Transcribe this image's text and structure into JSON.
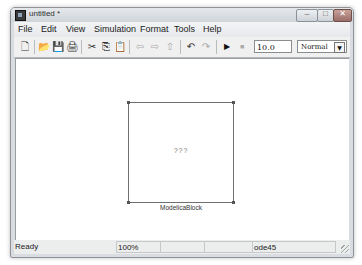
{
  "window": {
    "title": "untitled *",
    "icon": "simulink-model-icon",
    "controls": {
      "minimize": "–",
      "maximize": "□",
      "close": "✕"
    }
  },
  "menubar": {
    "items": [
      {
        "label": "File"
      },
      {
        "label": "Edit"
      },
      {
        "label": "View"
      },
      {
        "label": "Simulation"
      },
      {
        "label": "Format"
      },
      {
        "label": "Tools"
      },
      {
        "label": "Help"
      }
    ]
  },
  "toolbar": {
    "buttons": [
      {
        "name": "new-model",
        "icon": "new-document-icon",
        "glyph": "🗋"
      },
      {
        "name": "open",
        "icon": "open-folder-icon",
        "glyph": "📂"
      },
      {
        "name": "save",
        "icon": "save-icon",
        "glyph": "💾"
      },
      {
        "name": "print",
        "icon": "print-icon",
        "glyph": "🖨"
      },
      {
        "name": "cut",
        "icon": "cut-icon",
        "glyph": "✂"
      },
      {
        "name": "copy",
        "icon": "copy-icon",
        "glyph": "⎘"
      },
      {
        "name": "paste",
        "icon": "paste-icon",
        "glyph": "📋"
      },
      {
        "name": "back",
        "icon": "arrow-left-icon",
        "glyph": "⇦"
      },
      {
        "name": "forward",
        "icon": "arrow-right-icon",
        "glyph": "⇨"
      },
      {
        "name": "up",
        "icon": "arrow-up-icon",
        "glyph": "⇧"
      },
      {
        "name": "undo",
        "icon": "undo-icon",
        "glyph": "↶"
      },
      {
        "name": "redo",
        "icon": "redo-icon",
        "glyph": "↷"
      },
      {
        "name": "start-simulation",
        "icon": "play-icon",
        "glyph": "▶"
      },
      {
        "name": "stop-simulation",
        "icon": "stop-icon",
        "glyph": "■"
      }
    ],
    "stop_time": "10.0",
    "simulation_mode": "Normal",
    "dropdown_arrow": "▼"
  },
  "canvas": {
    "block": {
      "content": "???",
      "label": "ModelicaBlock"
    }
  },
  "statusbar": {
    "status": "Ready",
    "zoom": "100%",
    "cell3": "",
    "cell4": "",
    "solver": "ode45"
  }
}
